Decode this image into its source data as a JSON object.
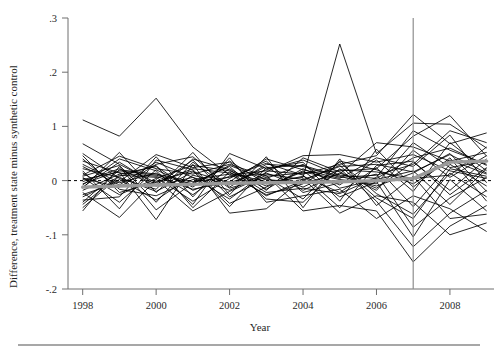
{
  "chart_data": {
    "type": "line",
    "title": "",
    "xlabel": "Year",
    "ylabel": "Difference, treatment state minus synthetic control",
    "xlim": [
      1997.6,
      2009.2
    ],
    "ylim": [
      -0.2,
      0.3
    ],
    "xticks": [
      1998,
      2000,
      2002,
      2004,
      2006,
      2008
    ],
    "xticklabels": [
      "1998",
      "2000",
      "2002",
      "2004",
      "2006",
      "2008"
    ],
    "yticks": [
      0.3,
      0.2,
      0.1,
      0.0,
      -0.1,
      -0.2
    ],
    "yticklabels": [
      ".3",
      ".2",
      "1",
      "0",
      "-.1",
      "-.2"
    ],
    "grid": false,
    "legend": null,
    "annotations": [
      {
        "name": "treatment-year-vertical-line",
        "type": "vline",
        "x": 2007,
        "color": "#8e8e8e"
      },
      {
        "name": "zero-reference-line",
        "type": "hline",
        "y": 0,
        "style": "dashed",
        "color": "#000000"
      }
    ],
    "x": [
      1998,
      1999,
      2000,
      2001,
      2002,
      2003,
      2004,
      2005,
      2006,
      2007,
      2008,
      2009
    ],
    "mean_series": {
      "name": "mean difference",
      "color": "#9a9a9a",
      "values": [
        -0.012,
        -0.01,
        -0.008,
        -0.007,
        -0.005,
        -0.004,
        -0.003,
        -0.002,
        0.0,
        0.004,
        0.034,
        0.036
      ]
    },
    "series": [
      {
        "name": "state-01",
        "values": [
          0.112,
          0.082,
          0.152,
          0.062,
          0.01,
          0.018,
          0.012,
          0.03,
          0.046,
          0.122,
          0.068,
          0.088
        ]
      },
      {
        "name": "state-02",
        "values": [
          0.068,
          0.03,
          -0.004,
          0.022,
          0.014,
          -0.002,
          0.006,
          0.252,
          0.05,
          0.106,
          0.104,
          0.06
        ]
      },
      {
        "name": "state-03",
        "values": [
          0.01,
          0.045,
          0.022,
          0.012,
          0.03,
          0.008,
          0.014,
          0.018,
          0.022,
          0.082,
          0.12,
          0.045
        ]
      },
      {
        "name": "state-04",
        "values": [
          0.004,
          -0.012,
          0.03,
          0.044,
          -0.012,
          0.03,
          0.026,
          0.006,
          0.01,
          0.03,
          0.092,
          0.07
        ]
      },
      {
        "name": "state-05",
        "values": [
          -0.006,
          0.018,
          0.01,
          -0.006,
          0.028,
          0.002,
          -0.004,
          0.012,
          0.07,
          0.062,
          0.036,
          0.052
        ]
      },
      {
        "name": "state-06",
        "values": [
          0.022,
          0.006,
          -0.02,
          0.016,
          -0.004,
          0.02,
          0.038,
          0.01,
          0.004,
          0.042,
          0.06,
          0.028
        ]
      },
      {
        "name": "state-07",
        "values": [
          -0.018,
          0.012,
          0.026,
          -0.018,
          0.008,
          0.012,
          0.002,
          0.026,
          0.03,
          0.016,
          0.048,
          0.014
        ]
      },
      {
        "name": "state-08",
        "values": [
          0.014,
          -0.026,
          0.004,
          0.028,
          0.018,
          -0.01,
          0.016,
          0.002,
          -0.006,
          0.07,
          0.024,
          0.036
        ]
      },
      {
        "name": "state-09",
        "values": [
          -0.002,
          0.022,
          -0.01,
          0.006,
          -0.018,
          0.014,
          -0.012,
          0.02,
          0.016,
          0.004,
          0.01,
          0.062
        ]
      },
      {
        "name": "state-10",
        "values": [
          0.03,
          -0.004,
          0.014,
          -0.026,
          0.022,
          -0.016,
          0.022,
          -0.008,
          0.038,
          -0.02,
          0.07,
          0.018
        ]
      },
      {
        "name": "state-11",
        "values": [
          -0.03,
          0.002,
          -0.036,
          0.01,
          -0.008,
          0.026,
          -0.018,
          0.014,
          -0.014,
          0.034,
          -0.018,
          0.04
        ]
      },
      {
        "name": "state-12",
        "values": [
          0.006,
          -0.04,
          0.02,
          -0.012,
          0.036,
          -0.006,
          0.008,
          -0.022,
          0.024,
          -0.048,
          0.03,
          -0.01
        ]
      },
      {
        "name": "state-13",
        "values": [
          -0.012,
          0.034,
          -0.008,
          0.038,
          -0.03,
          0.004,
          0.03,
          -0.014,
          0.002,
          0.018,
          -0.044,
          0.022
        ]
      },
      {
        "name": "state-14",
        "values": [
          0.04,
          -0.016,
          -0.028,
          0.002,
          0.012,
          -0.026,
          -0.006,
          0.034,
          -0.024,
          -0.062,
          0.014,
          -0.03
        ]
      },
      {
        "name": "state-15",
        "values": [
          -0.044,
          0.01,
          0.006,
          -0.038,
          0.004,
          0.036,
          -0.022,
          -0.004,
          0.012,
          -0.086,
          -0.032,
          0.006
        ]
      },
      {
        "name": "state-16",
        "values": [
          0.018,
          -0.052,
          0.038,
          0.02,
          -0.042,
          -0.012,
          0.018,
          -0.03,
          -0.002,
          -0.104,
          0.002,
          -0.056
        ]
      },
      {
        "name": "state-17",
        "values": [
          -0.056,
          0.026,
          -0.054,
          -0.004,
          0.026,
          -0.034,
          -0.04,
          0.022,
          -0.038,
          -0.122,
          -0.06,
          -0.018
        ]
      },
      {
        "name": "state-18",
        "values": [
          -0.022,
          -0.068,
          0.002,
          -0.056,
          -0.02,
          0.01,
          -0.056,
          -0.046,
          -0.056,
          -0.15,
          -0.084,
          -0.046
        ]
      },
      {
        "name": "state-19",
        "values": [
          0.002,
          0.016,
          -0.072,
          0.03,
          -0.06,
          -0.052,
          0.004,
          -0.06,
          -0.028,
          -0.04,
          -0.1,
          -0.078
        ]
      },
      {
        "name": "state-20",
        "values": [
          -0.036,
          -0.03,
          0.044,
          -0.03,
          0.042,
          -0.04,
          -0.028,
          -0.016,
          -0.07,
          -0.028,
          -0.052,
          -0.094
        ]
      },
      {
        "name": "state-21",
        "values": [
          0.05,
          0.004,
          -0.016,
          0.052,
          -0.026,
          0.044,
          -0.05,
          0.04,
          -0.046,
          0.008,
          -0.07,
          -0.062
        ]
      },
      {
        "name": "state-22",
        "values": [
          -0.008,
          0.04,
          0.018,
          -0.044,
          0.05,
          0.022,
          0.034,
          -0.038,
          0.058,
          -0.012,
          0.042,
          -0.038
        ]
      },
      {
        "name": "state-23",
        "values": [
          0.026,
          -0.008,
          0.034,
          0.006,
          -0.034,
          0.016,
          0.046,
          0.048,
          0.034,
          0.048,
          0.018,
          0.004
        ]
      },
      {
        "name": "state-24",
        "values": [
          -0.014,
          0.052,
          -0.022,
          0.04,
          0.02,
          -0.022,
          -0.014,
          -0.024,
          0.006,
          0.092,
          0.056,
          0.03
        ]
      },
      {
        "name": "state-25",
        "values": [
          0.036,
          0.014,
          0.008,
          -0.016,
          -0.002,
          0.04,
          0.02,
          0.004,
          0.042,
          0.026,
          0.084,
          -0.004
        ]
      },
      {
        "name": "state-26",
        "values": [
          -0.026,
          -0.002,
          0.048,
          0.024,
          0.034,
          -0.018,
          0.042,
          0.016,
          -0.018,
          0.056,
          0.006,
          0.046
        ]
      },
      {
        "name": "state-27",
        "values": [
          0.008,
          0.028,
          -0.04,
          0.034,
          -0.014,
          0.006,
          -0.034,
          0.036,
          0.02,
          -0.006,
          0.038,
          0.012
        ]
      },
      {
        "name": "state-28",
        "values": [
          -0.04,
          0.02,
          0.012,
          -0.002,
          0.006,
          0.032,
          0.01,
          -0.05,
          0.028,
          0.036,
          -0.026,
          0.024
        ]
      },
      {
        "name": "state-29",
        "values": [
          0.046,
          -0.022,
          -0.002,
          0.018,
          -0.048,
          0.024,
          0.028,
          0.008,
          -0.01,
          0.014,
          0.05,
          -0.02
        ]
      },
      {
        "name": "state-30",
        "values": [
          -0.05,
          0.008,
          0.028,
          -0.05,
          0.016,
          -0.028,
          0.0,
          0.028,
          -0.032,
          -0.07,
          0.022,
          0.008
        ]
      }
    ]
  },
  "figure": {
    "background": "#ffffff",
    "line_color": "#000000",
    "mean_color": "#9a9a9a",
    "axis_color": "#6f6f6f"
  }
}
